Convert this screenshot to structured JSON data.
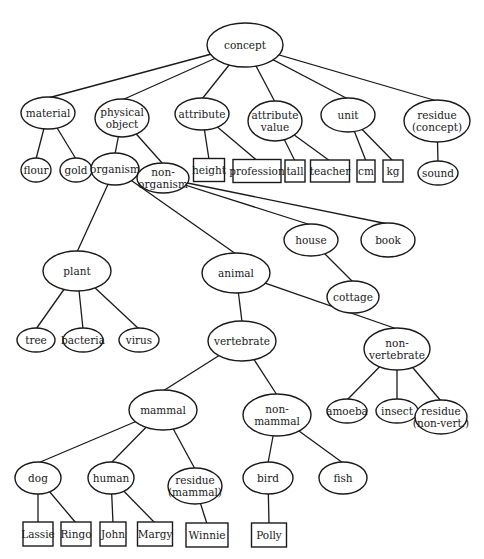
{
  "diagram": {
    "type": "concept-hierarchy-tree",
    "colors": {
      "line": "#1a1a1a",
      "background": "#ffffff"
    },
    "nodes": [
      {
        "id": "concept",
        "label": [
          "concept"
        ],
        "shape": "ellipse",
        "x": 245,
        "y": 45,
        "rx": 38,
        "ry": 22
      },
      {
        "id": "material",
        "label": [
          "material"
        ],
        "shape": "ellipse",
        "x": 48,
        "y": 113,
        "rx": 27,
        "ry": 16
      },
      {
        "id": "physical-object",
        "label": [
          "physical",
          "object"
        ],
        "shape": "ellipse",
        "x": 122,
        "y": 118,
        "rx": 27,
        "ry": 19
      },
      {
        "id": "attribute",
        "label": [
          "attribute"
        ],
        "shape": "ellipse",
        "x": 202,
        "y": 114,
        "rx": 27,
        "ry": 16
      },
      {
        "id": "attribute-value",
        "label": [
          "attribute",
          "value"
        ],
        "shape": "ellipse",
        "x": 275,
        "y": 121,
        "rx": 27,
        "ry": 20
      },
      {
        "id": "unit",
        "label": [
          "unit"
        ],
        "shape": "ellipse",
        "x": 348,
        "y": 115,
        "rx": 27,
        "ry": 17
      },
      {
        "id": "residue-concept",
        "label": [
          "residue",
          "(concept)"
        ],
        "shape": "ellipse",
        "x": 437,
        "y": 121,
        "rx": 33,
        "ry": 21
      },
      {
        "id": "flour",
        "label": [
          "flour"
        ],
        "shape": "ellipse",
        "x": 36,
        "y": 170,
        "rx": 15,
        "ry": 12
      },
      {
        "id": "gold",
        "label": [
          "gold"
        ],
        "shape": "ellipse",
        "x": 76,
        "y": 170,
        "rx": 16,
        "ry": 12
      },
      {
        "id": "organism",
        "label": [
          "organism"
        ],
        "shape": "ellipse",
        "x": 115,
        "y": 169,
        "rx": 24,
        "ry": 16
      },
      {
        "id": "non-organism",
        "label": [
          "non-",
          "organism"
        ],
        "shape": "ellipse",
        "x": 163,
        "y": 178,
        "rx": 26,
        "ry": 15
      },
      {
        "id": "height",
        "label": [
          "height"
        ],
        "shape": "box",
        "x": 209,
        "y": 170,
        "w": 31,
        "h": 23
      },
      {
        "id": "profession",
        "label": [
          "profession"
        ],
        "shape": "box",
        "x": 257,
        "y": 171,
        "w": 48,
        "h": 23
      },
      {
        "id": "tall",
        "label": [
          "tall"
        ],
        "shape": "box",
        "x": 295,
        "y": 171,
        "w": 20,
        "h": 22
      },
      {
        "id": "teacher",
        "label": [
          "teacher"
        ],
        "shape": "box",
        "x": 330,
        "y": 171,
        "w": 39,
        "h": 22
      },
      {
        "id": "cm",
        "label": [
          "cm"
        ],
        "shape": "box",
        "x": 366,
        "y": 171,
        "w": 18,
        "h": 22
      },
      {
        "id": "kg",
        "label": [
          "kg"
        ],
        "shape": "box",
        "x": 393,
        "y": 171,
        "w": 20,
        "h": 22
      },
      {
        "id": "sound",
        "label": [
          "sound"
        ],
        "shape": "ellipse",
        "x": 438,
        "y": 173,
        "rx": 20,
        "ry": 12
      },
      {
        "id": "house",
        "label": [
          "house"
        ],
        "shape": "ellipse",
        "x": 311,
        "y": 240,
        "rx": 27,
        "ry": 16
      },
      {
        "id": "book",
        "label": [
          "book"
        ],
        "shape": "ellipse",
        "x": 388,
        "y": 240,
        "rx": 27,
        "ry": 17
      },
      {
        "id": "plant",
        "label": [
          "plant"
        ],
        "shape": "ellipse",
        "x": 77,
        "y": 271,
        "rx": 34,
        "ry": 20
      },
      {
        "id": "animal",
        "label": [
          "animal"
        ],
        "shape": "ellipse",
        "x": 236,
        "y": 273,
        "rx": 34,
        "ry": 20
      },
      {
        "id": "cottage",
        "label": [
          "cottage"
        ],
        "shape": "ellipse",
        "x": 353,
        "y": 297,
        "rx": 26,
        "ry": 16
      },
      {
        "id": "tree",
        "label": [
          "tree"
        ],
        "shape": "ellipse",
        "x": 36,
        "y": 340,
        "rx": 19,
        "ry": 12
      },
      {
        "id": "bacteria",
        "label": [
          "bacteria"
        ],
        "shape": "ellipse",
        "x": 83,
        "y": 340,
        "rx": 20,
        "ry": 12
      },
      {
        "id": "virus",
        "label": [
          "virus"
        ],
        "shape": "ellipse",
        "x": 139,
        "y": 340,
        "rx": 20,
        "ry": 12
      },
      {
        "id": "vertebrate",
        "label": [
          "vertebrate"
        ],
        "shape": "ellipse",
        "x": 242,
        "y": 341,
        "rx": 34,
        "ry": 20
      },
      {
        "id": "non-vertebrate",
        "label": [
          "non-",
          "vertebrate"
        ],
        "shape": "ellipse",
        "x": 397,
        "y": 349,
        "rx": 33,
        "ry": 21
      },
      {
        "id": "mammal",
        "label": [
          "mammal"
        ],
        "shape": "ellipse",
        "x": 163,
        "y": 410,
        "rx": 34,
        "ry": 20
      },
      {
        "id": "non-mammal",
        "label": [
          "non-",
          "mammal"
        ],
        "shape": "ellipse",
        "x": 277,
        "y": 415,
        "rx": 34,
        "ry": 21
      },
      {
        "id": "amoeba",
        "label": [
          "amoeba"
        ],
        "shape": "ellipse",
        "x": 347,
        "y": 411,
        "rx": 20,
        "ry": 12
      },
      {
        "id": "insect",
        "label": [
          "insect"
        ],
        "shape": "ellipse",
        "x": 397,
        "y": 411,
        "rx": 21,
        "ry": 12
      },
      {
        "id": "residue-non-vert",
        "label": [
          "residue",
          "(non-vert.)"
        ],
        "shape": "ellipse",
        "x": 441,
        "y": 417,
        "rx": 26,
        "ry": 17
      },
      {
        "id": "dog",
        "label": [
          "dog"
        ],
        "shape": "ellipse",
        "x": 38,
        "y": 478,
        "rx": 23,
        "ry": 16
      },
      {
        "id": "human",
        "label": [
          "human"
        ],
        "shape": "ellipse",
        "x": 111,
        "y": 478,
        "rx": 23,
        "ry": 16
      },
      {
        "id": "residue-mammal",
        "label": [
          "residue",
          "(mammal)"
        ],
        "shape": "ellipse",
        "x": 195,
        "y": 486,
        "rx": 27,
        "ry": 18
      },
      {
        "id": "bird",
        "label": [
          "bird"
        ],
        "shape": "ellipse",
        "x": 268,
        "y": 478,
        "rx": 25,
        "ry": 16
      },
      {
        "id": "fish",
        "label": [
          "fish"
        ],
        "shape": "ellipse",
        "x": 343,
        "y": 478,
        "rx": 24,
        "ry": 16
      },
      {
        "id": "lassie",
        "label": [
          "Lassie"
        ],
        "shape": "box",
        "x": 38,
        "y": 534,
        "w": 30,
        "h": 24
      },
      {
        "id": "ringo",
        "label": [
          "Ringo"
        ],
        "shape": "box",
        "x": 76,
        "y": 534,
        "w": 30,
        "h": 24
      },
      {
        "id": "john",
        "label": [
          "John"
        ],
        "shape": "box",
        "x": 113,
        "y": 534,
        "w": 26,
        "h": 24
      },
      {
        "id": "margy",
        "label": [
          "Margy"
        ],
        "shape": "box",
        "x": 155,
        "y": 534,
        "w": 35,
        "h": 24
      },
      {
        "id": "winnie",
        "label": [
          "Winnie"
        ],
        "shape": "box",
        "x": 207,
        "y": 535,
        "w": 42,
        "h": 24
      },
      {
        "id": "polly",
        "label": [
          "Polly"
        ],
        "shape": "box",
        "x": 269,
        "y": 535,
        "w": 35,
        "h": 24
      }
    ],
    "edges": [
      [
        "concept",
        "material"
      ],
      [
        "concept",
        "physical-object"
      ],
      [
        "concept",
        "attribute"
      ],
      [
        "concept",
        "attribute-value"
      ],
      [
        "concept",
        "unit"
      ],
      [
        "concept",
        "residue-concept"
      ],
      [
        "material",
        "flour"
      ],
      [
        "material",
        "gold"
      ],
      [
        "physical-object",
        "organism"
      ],
      [
        "physical-object",
        "non-organism"
      ],
      [
        "attribute",
        "height"
      ],
      [
        "attribute",
        "profession"
      ],
      [
        "attribute-value",
        "tall"
      ],
      [
        "attribute-value",
        "teacher"
      ],
      [
        "unit",
        "cm"
      ],
      [
        "unit",
        "kg"
      ],
      [
        "residue-concept",
        "sound"
      ],
      [
        "organism",
        "plant"
      ],
      [
        "organism",
        "animal"
      ],
      [
        "non-organism",
        "house"
      ],
      [
        "non-organism",
        "book"
      ],
      [
        "house",
        "cottage"
      ],
      [
        "plant",
        "tree"
      ],
      [
        "plant",
        "bacteria"
      ],
      [
        "plant",
        "virus"
      ],
      [
        "animal",
        "vertebrate"
      ],
      [
        "animal",
        "non-vertebrate"
      ],
      [
        "vertebrate",
        "mammal"
      ],
      [
        "vertebrate",
        "non-mammal"
      ],
      [
        "non-vertebrate",
        "amoeba"
      ],
      [
        "non-vertebrate",
        "insect"
      ],
      [
        "non-vertebrate",
        "residue-non-vert"
      ],
      [
        "mammal",
        "dog"
      ],
      [
        "mammal",
        "human"
      ],
      [
        "mammal",
        "residue-mammal"
      ],
      [
        "non-mammal",
        "bird"
      ],
      [
        "non-mammal",
        "fish"
      ],
      [
        "dog",
        "lassie"
      ],
      [
        "dog",
        "ringo"
      ],
      [
        "human",
        "john"
      ],
      [
        "human",
        "margy"
      ],
      [
        "residue-mammal",
        "winnie"
      ],
      [
        "bird",
        "polly"
      ]
    ]
  }
}
